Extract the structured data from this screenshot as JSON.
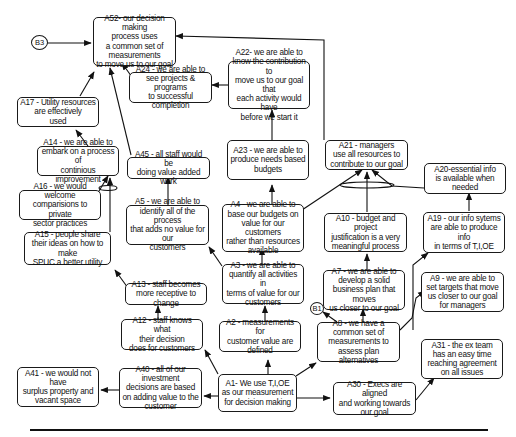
{
  "diagram": {
    "type": "prerequisite-tree",
    "connectors": [
      {
        "id": "B3",
        "label": "B3"
      },
      {
        "id": "B1",
        "label": "B1"
      }
    ],
    "nodes": [
      {
        "id": "A52",
        "text": "A52- our decision making\nprocess uses\na common set of\nmeasurements\nto move us to our goal"
      },
      {
        "id": "A24",
        "text": "A24 - we are able to\nsee projects & programs\nto successful completion"
      },
      {
        "id": "A22",
        "text": "A22- we are able to\nknow the contribution to\nmove us to our goal that\neach activity would have\nbefore we start it"
      },
      {
        "id": "A17",
        "text": "A17 - Utility resources\nare effectively\nused"
      },
      {
        "id": "A23",
        "text": "A23 - we are able to\nproduce needs based\nbudgets"
      },
      {
        "id": "A21",
        "text": "A21 - managers\nuse all resources to\ncontribute to our goal"
      },
      {
        "id": "A14",
        "text": "A14 - we are able to\nembark on a process of\ncontinious improvement"
      },
      {
        "id": "A45",
        "text": "A45 - all staff would be\ndoing value added work"
      },
      {
        "id": "A20",
        "text": "A20-essential info\nis available when\nneeded"
      },
      {
        "id": "A16",
        "text": "A16 - we would welcome\ncomparisions to private\nsector practices"
      },
      {
        "id": "A5",
        "text": "A5 - we are able to\nidentify all of the process\nthat adds no value for our\ncustomers"
      },
      {
        "id": "A4",
        "text": "A4 - we are able to\nbase our budgets on\nvalue for our customers\nrather than resources\navailable"
      },
      {
        "id": "A10",
        "text": "A10 - budget and project\njustification is a very\nmeaningful process"
      },
      {
        "id": "A19",
        "text": "A19 - our info sytems\nare able to produce info\nin terms of T,I,OE"
      },
      {
        "id": "A15",
        "text": "A15 - people share\ntheir ideas on how to make\nSPUC a better utility"
      },
      {
        "id": "A3",
        "text": "A3 - we are able to\nquantify all activities in\nterms of value for our\ncustomers"
      },
      {
        "id": "A7",
        "text": "A7 - we are able to\ndevelop a solid\nbusiness plan that moves\nus closer to our goal"
      },
      {
        "id": "A9",
        "text": "A9 - we are able to\nset targets that move\nus closer to our goal\nfor managers"
      },
      {
        "id": "A13",
        "text": "A13 - staff becomes\nmore receptive to change"
      },
      {
        "id": "A12",
        "text": "A12 - staff knows what\ntheir decision\ndoes for customers"
      },
      {
        "id": "A2",
        "text": "A2 - measurements for\ncustomer value are\ndefined"
      },
      {
        "id": "A8",
        "text": "A8 - we have a\ncommon set of\nmeasurements to\nassess plan alternatives"
      },
      {
        "id": "A31",
        "text": "A31 - the ex team\nhas an easy time\nreaching agreement\non all issues"
      },
      {
        "id": "A41",
        "text": "A41 - we would not have\nsurplus property and\nvacant space"
      },
      {
        "id": "A40",
        "text": "A40 - all of our investment\ndecisions are based\non adding value to  the\ncustomer"
      },
      {
        "id": "A1",
        "text": "A1- We use T,I,OE\nas our measurement\nfor decision making"
      },
      {
        "id": "A30",
        "text": "A30 - Execs are aligned\nand working towards\nour goal"
      }
    ],
    "edges": [
      [
        "B3",
        "A52"
      ],
      [
        "A24",
        "A52"
      ],
      [
        "A21",
        "A52"
      ],
      [
        "A17",
        "A52"
      ],
      [
        "A45",
        "A52"
      ],
      [
        "A22",
        "A24"
      ],
      [
        "A23",
        "A22"
      ],
      [
        "A14",
        "A17"
      ],
      [
        "A16",
        "A14"
      ],
      [
        "A15",
        "A14"
      ],
      [
        "A4",
        "A23"
      ],
      [
        "A4",
        "A21"
      ],
      [
        "A10",
        "A21"
      ],
      [
        "A20",
        "A21"
      ],
      [
        "A5",
        "A45"
      ],
      [
        "A3",
        "A4"
      ],
      [
        "A3",
        "A5"
      ],
      [
        "A19",
        "A20"
      ],
      [
        "A7",
        "A10"
      ],
      [
        "A8",
        "A7"
      ],
      [
        "A8",
        "A9"
      ],
      [
        "A8",
        "B1"
      ],
      [
        "A13",
        "A15"
      ],
      [
        "A12",
        "A13"
      ],
      [
        "A2",
        "A3"
      ],
      [
        "A1",
        "A2"
      ],
      [
        "A1",
        "A12"
      ],
      [
        "A1",
        "A8"
      ],
      [
        "A1",
        "A40"
      ],
      [
        "A1",
        "A30"
      ],
      [
        "A40",
        "A41"
      ],
      [
        "A30",
        "A31"
      ]
    ]
  }
}
